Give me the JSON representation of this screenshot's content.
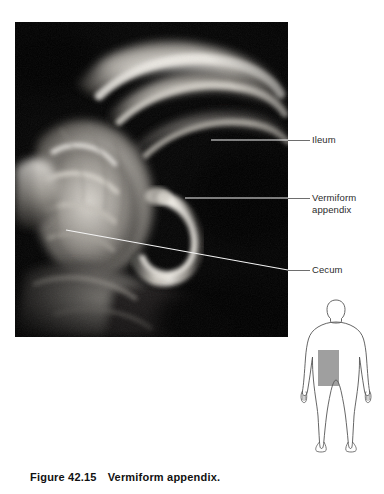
{
  "figure": {
    "caption_number": "Figure 42.15",
    "caption_title": "Vermiform appendix.",
    "photo_alt": "gross-dissection-photograph-of-ileum-cecum-and-vermiform-appendix"
  },
  "labels": [
    {
      "id": "ileum",
      "text": "Ileum"
    },
    {
      "id": "appendix",
      "text": "Vermiform\nappendix"
    },
    {
      "id": "cecum",
      "text": "Cecum"
    }
  ],
  "orientation_figure": {
    "name": "human-body-silhouette",
    "highlight_region": "right-lower-quadrant"
  },
  "colors": {
    "photo_background": "#050505",
    "leader_inside": "#f2f2f2",
    "leader_outside": "#6e6e6e",
    "label_text": "#2b2b2b",
    "caption_text": "#111111",
    "body_outline": "#555555",
    "body_highlight": "#8e8e8e"
  }
}
